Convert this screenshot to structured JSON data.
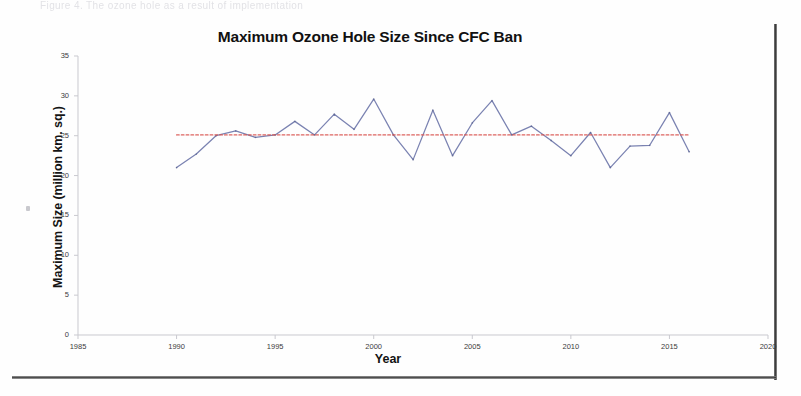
{
  "document": {
    "top_text_fragment": "Figure 4. The ozone hole as a result of implementation"
  },
  "chart_data": {
    "type": "line",
    "title": "Maximum Ozone Hole Size Since CFC Ban",
    "xlabel": "Year",
    "ylabel": "Maximum Size (million km. sq.)",
    "xlim": [
      1985,
      2020
    ],
    "ylim": [
      0,
      35
    ],
    "xticks": [
      1985,
      1990,
      1995,
      2000,
      2005,
      2010,
      2015,
      2020
    ],
    "yticks": [
      0,
      5,
      10,
      15,
      20,
      25,
      30,
      35
    ],
    "grid": false,
    "legend": "none",
    "series": [
      {
        "name": "Maximum ozone hole size",
        "color": "#6b74a8",
        "style": "solid",
        "x": [
          1990,
          1991,
          1992,
          1993,
          1994,
          1995,
          1996,
          1997,
          1998,
          1999,
          2000,
          2001,
          2002,
          2003,
          2004,
          2005,
          2006,
          2007,
          2008,
          2009,
          2010,
          2011,
          2012,
          2013,
          2014,
          2015,
          2016
        ],
        "values": [
          21.0,
          22.7,
          25.0,
          25.6,
          24.8,
          25.1,
          26.8,
          25.1,
          27.7,
          25.8,
          29.6,
          25.1,
          22.0,
          28.2,
          22.5,
          26.6,
          29.4,
          25.1,
          26.2,
          24.4,
          22.5,
          25.4,
          21.0,
          23.7,
          23.8,
          27.9,
          23.0
        ]
      },
      {
        "name": "Trend (average)",
        "color": "#d9534f",
        "style": "dotted",
        "x": [
          1990,
          2016
        ],
        "values": [
          25.1,
          25.1
        ]
      }
    ]
  }
}
